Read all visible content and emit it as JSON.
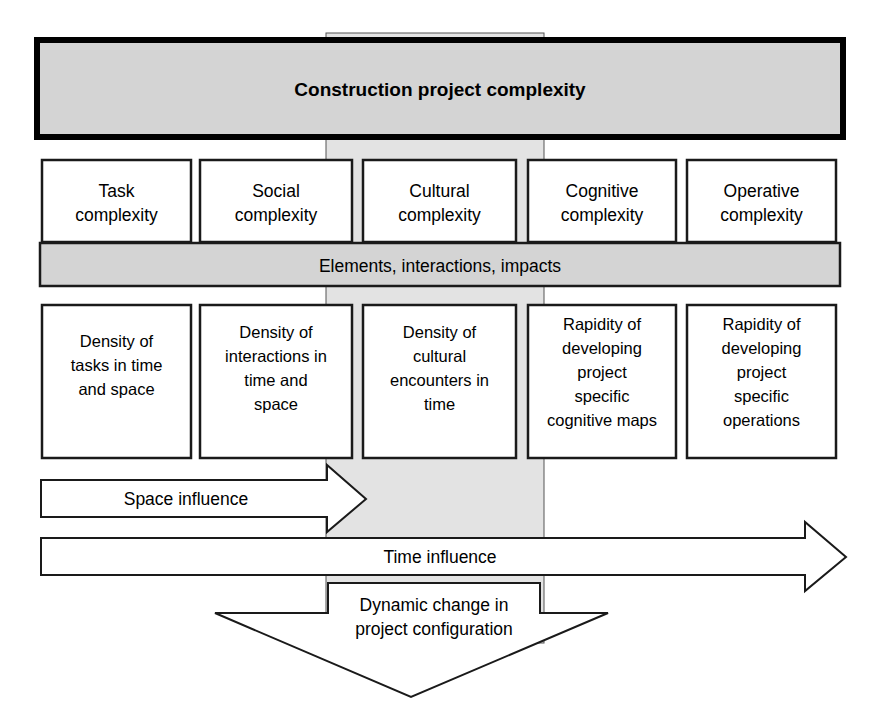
{
  "figure": {
    "type": "block-diagram",
    "title_box": {
      "label": "Construction project complexity",
      "fill": "#d4d4d4",
      "border": "#000000"
    },
    "category_row": {
      "items": [
        {
          "label_line1": "Task",
          "label_line2": "complexity"
        },
        {
          "label_line1": "Social",
          "label_line2": "complexity"
        },
        {
          "label_line1": "Cultural",
          "label_line2": "complexity"
        },
        {
          "label_line1": "Cognitive",
          "label_line2": "complexity"
        },
        {
          "label_line1": "Operative",
          "label_line2": "complexity"
        }
      ]
    },
    "middle_band": {
      "label": "Elements, interactions, impacts",
      "fill": "#d4d4d4"
    },
    "detail_row": {
      "items": [
        {
          "lines": [
            "Density of",
            "tasks in time",
            "and space"
          ]
        },
        {
          "lines": [
            "Density of",
            "interactions in",
            "time and",
            "space"
          ]
        },
        {
          "lines": [
            "Density of",
            "cultural",
            "encounters in",
            "time"
          ]
        },
        {
          "lines": [
            "Rapidity of",
            "developing",
            "project",
            "specific",
            "cognitive maps"
          ]
        },
        {
          "lines": [
            "Rapidity of",
            "developing",
            "project",
            "specific",
            "operations"
          ]
        }
      ]
    },
    "arrows": {
      "space": {
        "label": "Space influence",
        "direction": "right"
      },
      "time": {
        "label": "Time influence",
        "direction": "right"
      },
      "dynamic": {
        "line1": "Dynamic change in",
        "line2": "project configuration",
        "direction": "down"
      }
    },
    "vertical_band": {
      "name": "dynamic-change-flow-band",
      "fill": "#e3e3e3"
    }
  }
}
